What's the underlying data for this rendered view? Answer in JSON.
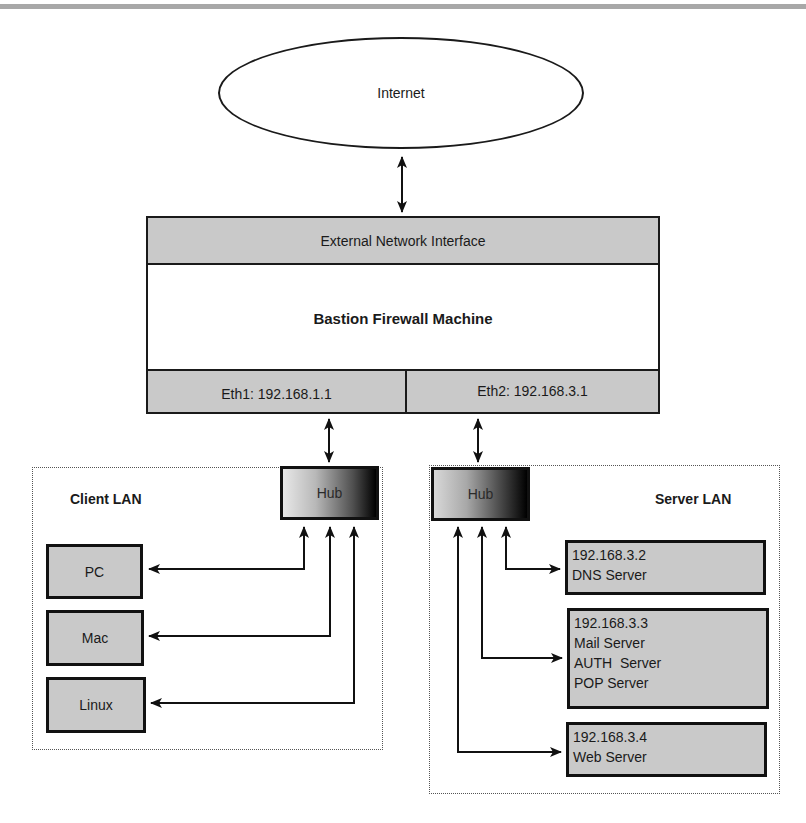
{
  "diagram": {
    "internet": {
      "label": "Internet"
    },
    "firewall": {
      "external_interface": "External Network Interface",
      "title": "Bastion Firewall Machine",
      "eth1": "Eth1: 192.168.1.1",
      "eth2": "Eth2: 192.168.3.1"
    },
    "client_lan": {
      "title": "Client LAN",
      "hub": "Hub",
      "hosts": [
        {
          "label": "PC"
        },
        {
          "label": "Mac"
        },
        {
          "label": "Linux"
        }
      ]
    },
    "server_lan": {
      "title": "Server LAN",
      "hub": "Hub",
      "servers": [
        {
          "ip": "192.168.3.2",
          "roles": [
            "DNS Server"
          ]
        },
        {
          "ip": "192.168.3.3",
          "roles": [
            "Mail Server",
            "AUTH  Server",
            "POP Server"
          ]
        },
        {
          "ip": "192.168.3.4",
          "roles": [
            "Web Server"
          ]
        }
      ]
    },
    "colors": {
      "box_fill": "#c9c9c9",
      "stroke": "#1a1a1a",
      "top_rule": "#a8a8a8"
    }
  }
}
